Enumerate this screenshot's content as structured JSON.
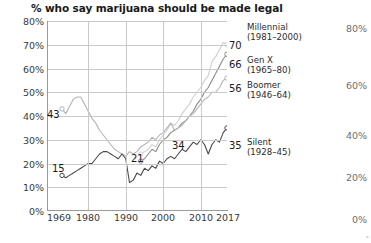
{
  "title": "% who say marijuana should be made legal",
  "axes": {
    "y_left_ticks": [
      "80%",
      "70%",
      "60%",
      "50%",
      "40%",
      "30%",
      "20%",
      "10%",
      "0%"
    ],
    "x_ticks": [
      "1969",
      "1980",
      "1990",
      "2000",
      "2010",
      "2017"
    ],
    "y_right_ticks": [
      "80%",
      "60%",
      "40%",
      "20%",
      "0%"
    ]
  },
  "legend": [
    {
      "name": "Millennial",
      "years": "(1981–2000)",
      "end_value": "70"
    },
    {
      "name": "Gen X",
      "years": "(1965–80)",
      "end_value": "66"
    },
    {
      "name": "Boomer",
      "years": "(1946–64)",
      "end_value": "56"
    },
    {
      "name": "Silent",
      "years": "(1928–45)",
      "end_value": "35"
    }
  ],
  "inline_labels": [
    {
      "text": "43",
      "series": "Boomer"
    },
    {
      "text": "15",
      "series": "Silent"
    },
    {
      "text": "21",
      "series": "Gen X"
    },
    {
      "text": "34",
      "series": "Boomer"
    }
  ],
  "colors": {
    "millennial": "#cfcfcf",
    "genx": "#8d8d8d",
    "boomer": "#b4b4b4",
    "silent": "#4a4a4a",
    "grid": "#c9c9c9",
    "axis": "#9a9a9a",
    "text": "#1a1a1a",
    "right_axis_text": "#6e6e6e"
  },
  "chart_data": {
    "type": "line",
    "title": "% who say marijuana should be made legal",
    "xlabel": "",
    "ylabel": "",
    "xlim": [
      1969,
      2017
    ],
    "ylim": [
      0,
      80
    ],
    "grid": true,
    "legend_position": "right",
    "x_ticks": [
      1969,
      1980,
      1990,
      2000,
      2010,
      2017
    ],
    "y_ticks": [
      0,
      10,
      20,
      30,
      40,
      50,
      60,
      70,
      80
    ],
    "series": [
      {
        "name": "Millennial (1981–2000)",
        "color": "#cfcfcf",
        "end_label": 70,
        "points": [
          [
            1994,
            24
          ],
          [
            1995,
            25
          ],
          [
            1996,
            26
          ],
          [
            1997,
            28
          ],
          [
            1998,
            27
          ],
          [
            1999,
            30
          ],
          [
            2000,
            32
          ],
          [
            2001,
            34
          ],
          [
            2002,
            37
          ],
          [
            2003,
            36
          ],
          [
            2004,
            38
          ],
          [
            2005,
            41
          ],
          [
            2006,
            43
          ],
          [
            2007,
            45
          ],
          [
            2008,
            48
          ],
          [
            2009,
            50
          ],
          [
            2010,
            52
          ],
          [
            2011,
            55
          ],
          [
            2012,
            57
          ],
          [
            2013,
            63
          ],
          [
            2014,
            65
          ],
          [
            2015,
            68
          ],
          [
            2016,
            71
          ],
          [
            2017,
            70
          ]
        ]
      },
      {
        "name": "Gen X (1965–80)",
        "color": "#8d8d8d",
        "end_label": 66,
        "points": [
          [
            1994,
            21
          ],
          [
            1995,
            22
          ],
          [
            1996,
            24
          ],
          [
            1997,
            26
          ],
          [
            1998,
            25
          ],
          [
            1999,
            28
          ],
          [
            2000,
            30
          ],
          [
            2001,
            31
          ],
          [
            2002,
            33
          ],
          [
            2003,
            34
          ],
          [
            2004,
            35
          ],
          [
            2005,
            37
          ],
          [
            2006,
            38
          ],
          [
            2007,
            40
          ],
          [
            2008,
            42
          ],
          [
            2009,
            45
          ],
          [
            2010,
            47
          ],
          [
            2011,
            50
          ],
          [
            2012,
            52
          ],
          [
            2013,
            55
          ],
          [
            2014,
            58
          ],
          [
            2015,
            61
          ],
          [
            2016,
            64
          ],
          [
            2017,
            66
          ]
        ]
      },
      {
        "name": "Boomer (1946–64)",
        "color": "#b4b4b4",
        "end_label": 56,
        "points": [
          [
            1973,
            43
          ],
          [
            1974,
            41
          ],
          [
            1975,
            44
          ],
          [
            1976,
            47
          ],
          [
            1977,
            48
          ],
          [
            1978,
            48
          ],
          [
            1979,
            45
          ],
          [
            1980,
            42
          ],
          [
            1981,
            39
          ],
          [
            1982,
            37
          ],
          [
            1983,
            34
          ],
          [
            1984,
            32
          ],
          [
            1985,
            30
          ],
          [
            1986,
            28
          ],
          [
            1987,
            26
          ],
          [
            1988,
            25
          ],
          [
            1989,
            24
          ],
          [
            1990,
            23
          ],
          [
            1991,
            25
          ],
          [
            1992,
            24
          ],
          [
            1993,
            25
          ],
          [
            1994,
            27
          ],
          [
            1995,
            28
          ],
          [
            1996,
            29
          ],
          [
            1997,
            31
          ],
          [
            1998,
            30
          ],
          [
            1999,
            32
          ],
          [
            2000,
            33
          ],
          [
            2001,
            35
          ],
          [
            2002,
            37
          ],
          [
            2003,
            34
          ],
          [
            2004,
            35
          ],
          [
            2005,
            36
          ],
          [
            2006,
            38
          ],
          [
            2007,
            40
          ],
          [
            2008,
            41
          ],
          [
            2009,
            43
          ],
          [
            2010,
            45
          ],
          [
            2011,
            47
          ],
          [
            2012,
            48
          ],
          [
            2013,
            50
          ],
          [
            2014,
            50
          ],
          [
            2015,
            52
          ],
          [
            2016,
            55
          ],
          [
            2017,
            56
          ]
        ]
      },
      {
        "name": "Silent (1928–45)",
        "color": "#4a4a4a",
        "end_label": 35,
        "points": [
          [
            1973,
            15
          ],
          [
            1974,
            14
          ],
          [
            1975,
            15
          ],
          [
            1976,
            16
          ],
          [
            1977,
            17
          ],
          [
            1978,
            18
          ],
          [
            1979,
            19
          ],
          [
            1980,
            20
          ],
          [
            1981,
            20
          ],
          [
            1982,
            22
          ],
          [
            1983,
            24
          ],
          [
            1984,
            25
          ],
          [
            1985,
            25
          ],
          [
            1986,
            24
          ],
          [
            1987,
            23
          ],
          [
            1988,
            22
          ],
          [
            1989,
            24
          ],
          [
            1990,
            22
          ],
          [
            1991,
            12
          ],
          [
            1992,
            13
          ],
          [
            1993,
            16
          ],
          [
            1994,
            15
          ],
          [
            1995,
            18
          ],
          [
            1996,
            17
          ],
          [
            1997,
            19
          ],
          [
            1998,
            18
          ],
          [
            1999,
            21
          ],
          [
            2000,
            20
          ],
          [
            2001,
            22
          ],
          [
            2002,
            23
          ],
          [
            2003,
            22
          ],
          [
            2004,
            24
          ],
          [
            2005,
            26
          ],
          [
            2006,
            25
          ],
          [
            2007,
            27
          ],
          [
            2008,
            29
          ],
          [
            2009,
            28
          ],
          [
            2010,
            30
          ],
          [
            2011,
            28
          ],
          [
            2012,
            24
          ],
          [
            2013,
            28
          ],
          [
            2014,
            30
          ],
          [
            2015,
            29
          ],
          [
            2016,
            33
          ],
          [
            2017,
            35
          ]
        ]
      }
    ]
  }
}
